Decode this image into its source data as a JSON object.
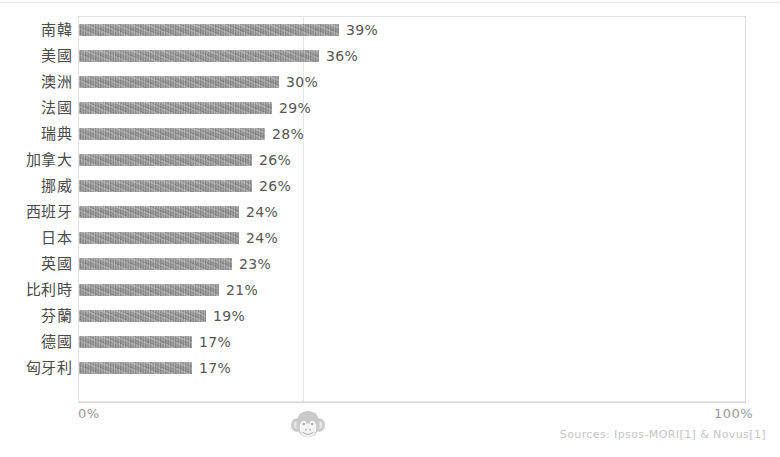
{
  "chart_data": {
    "type": "bar",
    "orientation": "horizontal",
    "title": "",
    "subtitle": "",
    "xlabel": "",
    "ylabel": "",
    "xlim": [
      0,
      100
    ],
    "grid": true,
    "gridlines_at": [
      50
    ],
    "legend": null,
    "axis_ticks": {
      "min_label": "0%",
      "max_label": "100%"
    },
    "categories": [
      "南韓",
      "美國",
      "澳洲",
      "法國",
      "瑞典",
      "加拿大",
      "挪威",
      "西班牙",
      "日本",
      "英國",
      "比利時",
      "芬蘭",
      "德國",
      "匈牙利"
    ],
    "values": [
      39,
      36,
      30,
      29,
      28,
      26,
      26,
      24,
      24,
      23,
      21,
      19,
      17,
      17
    ],
    "value_labels": [
      "39%",
      "36%",
      "30%",
      "29%",
      "28%",
      "26%",
      "26%",
      "24%",
      "24%",
      "23%",
      "21%",
      "19%",
      "17%",
      "17%"
    ],
    "bars": [
      {
        "category": "南韓",
        "value": 39,
        "label": "39%"
      },
      {
        "category": "美國",
        "value": 36,
        "label": "36%"
      },
      {
        "category": "澳洲",
        "value": 30,
        "label": "30%"
      },
      {
        "category": "法國",
        "value": 29,
        "label": "29%"
      },
      {
        "category": "瑞典",
        "value": 28,
        "label": "28%"
      },
      {
        "category": "加拿大",
        "value": 26,
        "label": "26%"
      },
      {
        "category": "挪威",
        "value": 26,
        "label": "26%"
      },
      {
        "category": "西班牙",
        "value": 24,
        "label": "24%"
      },
      {
        "category": "日本",
        "value": 24,
        "label": "24%"
      },
      {
        "category": "英國",
        "value": 23,
        "label": "23%"
      },
      {
        "category": "比利時",
        "value": 21,
        "label": "21%"
      },
      {
        "category": "芬蘭",
        "value": 19,
        "label": "19%"
      },
      {
        "category": "德國",
        "value": 17,
        "label": "17%"
      },
      {
        "category": "匈牙利",
        "value": 17,
        "label": "17%"
      }
    ],
    "colors": {
      "bar": "#8a8a8a",
      "frame": "#e2e2e2",
      "gridline": "#e6e6e6",
      "category_text": "#4a4a4a",
      "value_text": "#565656",
      "tick_text": "#9a9a9a",
      "source_text": "#c6c6c6",
      "background": "#fefefe"
    }
  },
  "footer": {
    "source": "Sources: Ipsos-MORI[1] & Novus[1]",
    "watermark_icon": "monkey-face-icon"
  }
}
